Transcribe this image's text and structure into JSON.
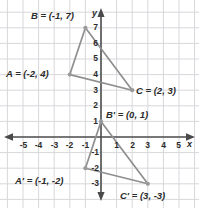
{
  "figure": {
    "type": "coordinate-plane-diagram",
    "background_color": "#ffffff",
    "grid_color": "#d8d8dc",
    "axis_color": "#4a4a4a",
    "shape_color": "#8a8a8a",
    "text_color": "#2b2b2b"
  },
  "axes": {
    "x_label": "x",
    "y_label": "y",
    "x_ticks": [
      "-5",
      "-4",
      "-3",
      "-2",
      "-1",
      "1",
      "2",
      "3",
      "4",
      "5"
    ],
    "y_ticks": [
      "7",
      "6",
      "5",
      "4",
      "3",
      "2",
      "1",
      "-1",
      "-2",
      "-3"
    ],
    "x_range": [
      -5.8,
      5.9
    ],
    "y_range": [
      -3.9,
      7.6
    ],
    "origin_px": [
      101,
      137
    ],
    "unit_px": 15.6
  },
  "triangles": [
    {
      "name": "triangle-abc",
      "vertices": [
        {
          "label": "A",
          "text": "A = (-2, 4)",
          "x": -2,
          "y": 4
        },
        {
          "label": "B",
          "text": "B = (-1, 7)",
          "x": -1,
          "y": 7
        },
        {
          "label": "C",
          "text": "C = (2, 3)",
          "x": 2,
          "y": 3
        }
      ]
    },
    {
      "name": "triangle-a-prime-b-prime-c-prime",
      "vertices": [
        {
          "label": "A'",
          "text": "A' = (-1, -2)",
          "x": -1,
          "y": -2
        },
        {
          "label": "B'",
          "text": "B' = (0, 1)",
          "x": 0,
          "y": 1
        },
        {
          "label": "C'",
          "text": "C' = (3, -3)",
          "x": 3,
          "y": -3
        }
      ]
    }
  ],
  "labels": {
    "A": "A = (-2, 4)",
    "B": "B = (-1, 7)",
    "C": "C = (2, 3)",
    "A_prime": "A' = (-1, -2)",
    "B_prime": "B' = (0, 1)",
    "C_prime": "C' = (3, -3)"
  },
  "ticks": {
    "xm5": "-5",
    "xm4": "-4",
    "xm3": "-3",
    "xm2": "-2",
    "xm1": "-1",
    "x1": "1",
    "x2": "2",
    "x3": "3",
    "x4": "4",
    "x5": "5",
    "y7": "7",
    "y6": "6",
    "y5": "5",
    "y4": "4",
    "y3": "3",
    "y2": "2",
    "y1": "1",
    "ym1": "-1",
    "ym2": "-2",
    "ym3": "-3"
  }
}
